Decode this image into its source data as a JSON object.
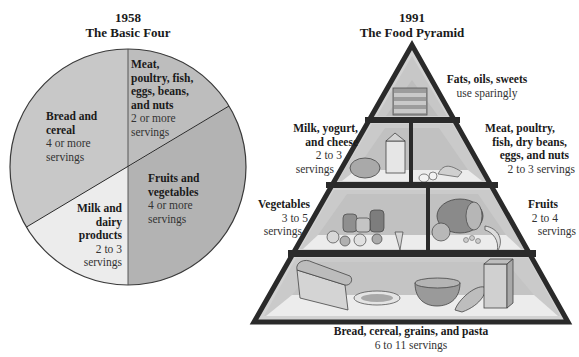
{
  "left": {
    "year": "1958",
    "title": "The Basic Four",
    "slices": [
      {
        "name": "Bread and cereal",
        "lines": [
          "Bread and",
          "cereal"
        ],
        "servings_lines": [
          "4 or more",
          "servings"
        ],
        "color": "#c8c8c8"
      },
      {
        "name": "Meat, poultry, fish, eggs, beans, and nuts",
        "lines": [
          "Meat,",
          "poultry, fish,",
          "eggs, beans,",
          "and nuts"
        ],
        "servings_lines": [
          "2 or more",
          "servings"
        ],
        "color": "#bdbdbd"
      },
      {
        "name": "Fruits and vegetables",
        "lines": [
          "Fruits and",
          "vegetables"
        ],
        "servings_lines": [
          "4 or more",
          "servings"
        ],
        "color": "#b3b3b3"
      },
      {
        "name": "Milk and dairy products",
        "lines": [
          "Milk and",
          "dairy",
          "products"
        ],
        "servings_lines": [
          "2 to 3",
          "servings"
        ],
        "color": "#ececec"
      }
    ]
  },
  "right": {
    "year": "1991",
    "title": "The Food Pyramid",
    "levels": [
      {
        "name": "Fats, oils, sweets",
        "lines": [
          "Fats, oils, sweets"
        ],
        "servings_lines": [
          "use sparingly"
        ]
      },
      {
        "name": "Milk, yogurt, and cheese",
        "lines": [
          "Milk, yogurt,",
          "and cheese"
        ],
        "servings_lines": [
          "2 to 3",
          "servings"
        ]
      },
      {
        "name": "Meat, poultry, fish, dry beans, eggs, and nuts",
        "lines": [
          "Meat, poultry,",
          "fish, dry beans,",
          "eggs, and nuts"
        ],
        "servings_lines": [
          "2 to 3 servings"
        ]
      },
      {
        "name": "Vegetables",
        "lines": [
          "Vegetables"
        ],
        "servings_lines": [
          "3 to 5",
          "servings"
        ]
      },
      {
        "name": "Fruits",
        "lines": [
          "Fruits"
        ],
        "servings_lines": [
          "2 to 4",
          "servings"
        ]
      },
      {
        "name": "Bread, cereal, grains, and pasta",
        "lines": [
          "Bread, cereal, grains, and pasta"
        ],
        "servings_lines": [
          "6 to 11 servings"
        ]
      }
    ]
  },
  "colors": {
    "pyramid_outline": "#2a2a2a",
    "pyramid_back": "#c9c9c9",
    "pyramid_floor": "#ededed",
    "pie_outline": "#3a3a3a"
  }
}
